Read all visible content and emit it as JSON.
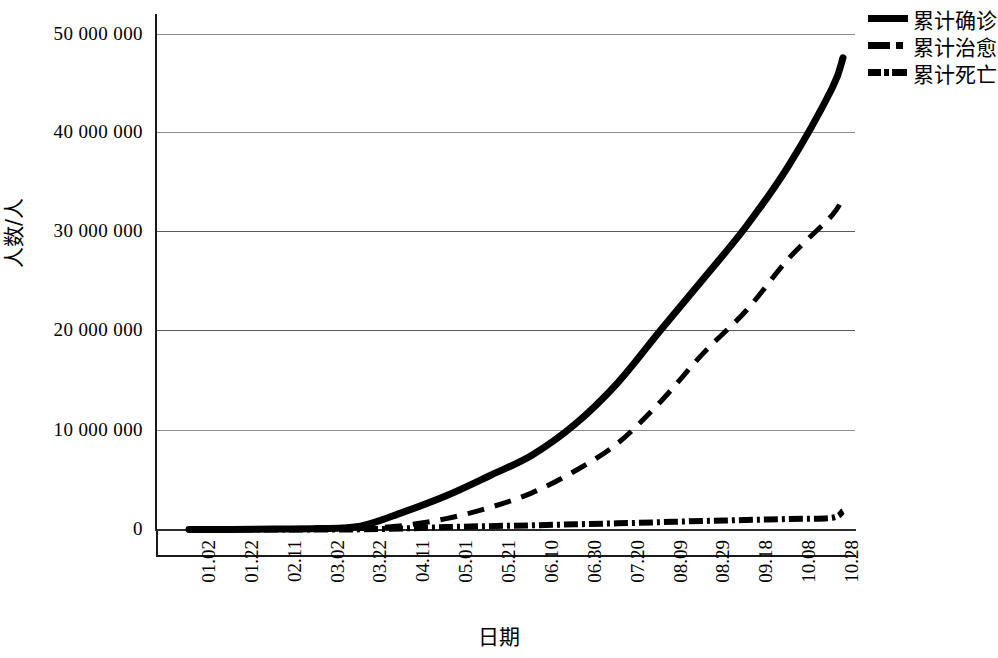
{
  "chart_data": {
    "type": "line",
    "title": "",
    "xlabel": "日期",
    "ylabel": "人数/人",
    "grid": true,
    "legend_position": "top-right",
    "ylim": [
      0,
      50000000
    ],
    "ytick_labels": [
      "50 000 000",
      "40 000 000",
      "30 000 000",
      "20 000 000",
      "10 000 000",
      "0"
    ],
    "ytick_values": [
      50000000,
      40000000,
      30000000,
      20000000,
      10000000,
      0
    ],
    "categories": [
      "01.02",
      "01.22",
      "02.11",
      "03.02",
      "03.22",
      "04.11",
      "05.01",
      "05.21",
      "06.10",
      "06.30",
      "07.20",
      "08.09",
      "08.29",
      "09.18",
      "10.08",
      "10.28"
    ],
    "series": [
      {
        "name": "累计确诊",
        "style": "solid",
        "values": [
          0,
          0,
          45000,
          90000,
          340000,
          1750000,
          3400000,
          5400000,
          7500000,
          10600000,
          14800000,
          20100000,
          25300000,
          30600000,
          36800000,
          44500000
        ],
        "final_value": 47600000
      },
      {
        "name": "累计治愈",
        "style": "dashed",
        "values": [
          0,
          0,
          5000,
          50000,
          100000,
          400000,
          1100000,
          2200000,
          3700000,
          5900000,
          8700000,
          12900000,
          17800000,
          22100000,
          27400000,
          31700000
        ],
        "final_value": 33600000
      },
      {
        "name": "累计死亡",
        "style": "dash-dot",
        "values": [
          0,
          0,
          1000,
          3000,
          15000,
          105000,
          240000,
          340000,
          420000,
          520000,
          620000,
          740000,
          860000,
          960000,
          1060000,
          1180000
        ],
        "final_value": 1850000
      }
    ]
  },
  "legend": {
    "items": [
      {
        "label": "累计确诊",
        "key": "solid-line-key"
      },
      {
        "label": "累计治愈",
        "key": "dash-dot-line-key"
      },
      {
        "label": "累计死亡",
        "key": "dash-dot-dash-line-key"
      }
    ]
  },
  "axes": {
    "y_title": "人数/人",
    "x_title": "日期"
  }
}
